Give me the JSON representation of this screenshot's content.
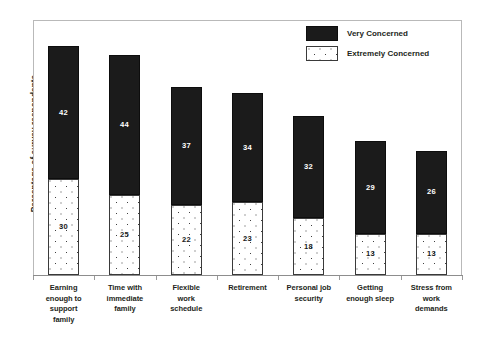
{
  "chart_data": {
    "type": "bar",
    "stacked": true,
    "title": "",
    "xlabel": "",
    "ylabel": "Percentage of survey respondents",
    "ylim": [
      0,
      80
    ],
    "grid": false,
    "legend_position": "top-right",
    "categories": [
      "Earning enough to support family",
      "Time with immediate family",
      "Flexible work schedule",
      "Retirement",
      "Personal job security",
      "Getting enough sleep",
      "Stress from work demands"
    ],
    "category_lines": [
      [
        "Earning",
        "enough to",
        "support",
        "family"
      ],
      [
        "Time with",
        "immediate",
        "family"
      ],
      [
        "Flexible",
        "work",
        "schedule"
      ],
      [
        "Retirement"
      ],
      [
        "Personal job",
        "security"
      ],
      [
        "Getting",
        "enough sleep"
      ],
      [
        "Stress from",
        "work",
        "demands"
      ]
    ],
    "series": [
      {
        "name": "Very Concerned",
        "color": "#1b1b1b",
        "values": [
          42,
          44,
          37,
          34,
          32,
          29,
          26
        ]
      },
      {
        "name": "Extremely Concerned",
        "color": "#ffffff",
        "pattern": "dotted",
        "values": [
          30,
          25,
          22,
          23,
          18,
          13,
          13
        ]
      }
    ],
    "totals": [
      72,
      69,
      59,
      57,
      50,
      42,
      39
    ]
  },
  "legend": {
    "items": [
      {
        "label": "Very Concerned",
        "swatch": "black-fill-swatch"
      },
      {
        "label": "Extremely Concerned",
        "swatch": "dotted-fill-swatch"
      }
    ]
  }
}
